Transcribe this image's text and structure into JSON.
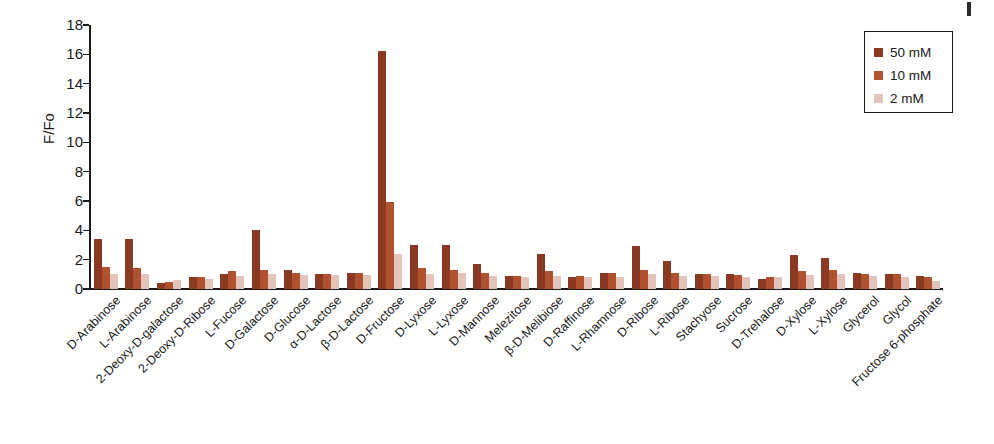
{
  "chart_data": {
    "type": "bar",
    "title": "",
    "xlabel": "",
    "ylabel": "F/Fo",
    "ylim": [
      0,
      18
    ],
    "yticks": [
      0,
      2,
      4,
      6,
      8,
      10,
      12,
      14,
      16,
      18
    ],
    "grid": false,
    "legend_position": "top-right",
    "categories": [
      "D-Arabinose",
      "L-Arabinose",
      "2-Deoxy-D-galactose",
      "2-Deoxy-D-Ribose",
      "L-Fucose",
      "D-Galactose",
      "D-Glucose",
      "α-D-Lactose",
      "β-D-Lactose",
      "D-Fructose",
      "D-Lyxose",
      "L-Lyxose",
      "D-Mannose",
      "Melezitose",
      "β-D-Melibiose",
      "D-Raffinose",
      "L-Rhamnose",
      "D-Ribose",
      "L-Ribose",
      "Stachyose",
      "Sucrose",
      "D-Trehalose",
      "D-Xylose",
      "L-Xylose",
      "Glycerol",
      "Glycol",
      "Fructose 6-phosphate"
    ],
    "series": [
      {
        "name": "50 mM",
        "color": "#8a3a22",
        "values": [
          3.4,
          3.4,
          0.4,
          0.8,
          1.0,
          4.0,
          1.3,
          1.0,
          1.1,
          16.2,
          3.0,
          3.0,
          1.7,
          0.9,
          2.4,
          0.8,
          1.1,
          2.9,
          1.9,
          1.0,
          1.0,
          0.7,
          2.3,
          2.1,
          1.1,
          1.0,
          0.9
        ]
      },
      {
        "name": "10 mM",
        "color": "#b0512f",
        "values": [
          1.5,
          1.4,
          0.5,
          0.8,
          1.2,
          1.3,
          1.1,
          1.0,
          1.1,
          5.9,
          1.4,
          1.3,
          1.1,
          0.9,
          1.2,
          0.9,
          1.1,
          1.3,
          1.1,
          1.0,
          0.95,
          0.85,
          1.2,
          1.3,
          1.0,
          1.0,
          0.85
        ]
      },
      {
        "name": "2 mM",
        "color": "#e3c4bb",
        "values": [
          1.0,
          1.0,
          0.6,
          0.7,
          0.9,
          1.0,
          0.95,
          0.95,
          0.95,
          2.4,
          1.0,
          1.1,
          0.9,
          0.8,
          0.9,
          0.8,
          0.8,
          1.0,
          0.9,
          0.9,
          0.85,
          0.8,
          0.95,
          1.0,
          0.9,
          0.85,
          0.55
        ]
      }
    ]
  },
  "legend": {
    "items": [
      {
        "label": "50 mM"
      },
      {
        "label": "10 mM"
      },
      {
        "label": "2 mM"
      }
    ]
  }
}
